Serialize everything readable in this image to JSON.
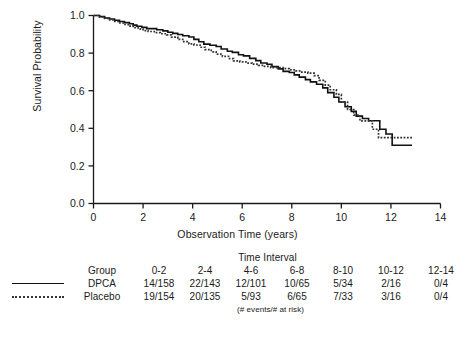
{
  "chart_data": {
    "type": "line",
    "title": "",
    "xlabel": "Observation Time (years)",
    "ylabel": "Survival Probability",
    "xlim": [
      0,
      14
    ],
    "ylim": [
      0,
      1.0
    ],
    "xticks": [
      "0",
      "2",
      "4",
      "6",
      "8",
      "10",
      "12",
      "14"
    ],
    "xtick_values": [
      0,
      2,
      4,
      6,
      8,
      10,
      12,
      14
    ],
    "yticks": [
      "0.0",
      "0.2",
      "0.4",
      "0.6",
      "0.8",
      "1.0"
    ],
    "ytick_values": [
      0.0,
      0.2,
      0.4,
      0.6,
      0.8,
      1.0
    ],
    "grid": false,
    "legend_position": "table-below",
    "step_style": "post",
    "series": [
      {
        "name": "DPCA",
        "style": "solid",
        "color": "#111111",
        "points": [
          [
            0.0,
            1.0
          ],
          [
            0.25,
            0.994
          ],
          [
            0.45,
            0.987
          ],
          [
            0.65,
            0.981
          ],
          [
            0.85,
            0.975
          ],
          [
            1.05,
            0.968
          ],
          [
            1.25,
            0.962
          ],
          [
            1.45,
            0.956
          ],
          [
            1.6,
            0.949
          ],
          [
            1.75,
            0.943
          ],
          [
            1.95,
            0.937
          ],
          [
            2.15,
            0.93
          ],
          [
            2.3,
            0.93
          ],
          [
            2.55,
            0.924
          ],
          [
            2.8,
            0.918
          ],
          [
            3.0,
            0.911
          ],
          [
            3.2,
            0.905
          ],
          [
            3.4,
            0.899
          ],
          [
            3.6,
            0.892
          ],
          [
            3.85,
            0.886
          ],
          [
            4.05,
            0.873
          ],
          [
            4.25,
            0.86
          ],
          [
            4.45,
            0.848
          ],
          [
            4.7,
            0.842
          ],
          [
            4.95,
            0.835
          ],
          [
            5.15,
            0.822
          ],
          [
            5.4,
            0.81
          ],
          [
            5.6,
            0.804
          ],
          [
            5.85,
            0.791
          ],
          [
            6.05,
            0.785
          ],
          [
            6.3,
            0.772
          ],
          [
            6.55,
            0.76
          ],
          [
            6.75,
            0.747
          ],
          [
            7.0,
            0.741
          ],
          [
            7.2,
            0.728
          ],
          [
            7.45,
            0.716
          ],
          [
            7.65,
            0.703
          ],
          [
            7.9,
            0.697
          ],
          [
            8.1,
            0.684
          ],
          [
            8.3,
            0.672
          ],
          [
            8.55,
            0.659
          ],
          [
            8.75,
            0.647
          ],
          [
            9.0,
            0.634
          ],
          [
            9.25,
            0.615
          ],
          [
            9.45,
            0.59
          ],
          [
            9.7,
            0.565
          ],
          [
            9.9,
            0.54
          ],
          [
            10.15,
            0.515
          ],
          [
            10.4,
            0.49
          ],
          [
            10.6,
            0.465
          ],
          [
            10.85,
            0.452
          ],
          [
            11.1,
            0.44
          ],
          [
            11.35,
            0.44
          ],
          [
            11.55,
            0.395
          ],
          [
            11.8,
            0.37
          ],
          [
            12.05,
            0.31
          ],
          [
            12.85,
            0.31
          ]
        ]
      },
      {
        "name": "Placebo",
        "style": "dotted",
        "color": "#333333",
        "points": [
          [
            0.0,
            1.0
          ],
          [
            0.2,
            0.992
          ],
          [
            0.4,
            0.984
          ],
          [
            0.6,
            0.976
          ],
          [
            0.8,
            0.968
          ],
          [
            1.0,
            0.96
          ],
          [
            1.2,
            0.952
          ],
          [
            1.4,
            0.944
          ],
          [
            1.6,
            0.936
          ],
          [
            1.8,
            0.928
          ],
          [
            2.0,
            0.92
          ],
          [
            2.2,
            0.915
          ],
          [
            2.45,
            0.909
          ],
          [
            2.7,
            0.903
          ],
          [
            2.95,
            0.897
          ],
          [
            3.15,
            0.885
          ],
          [
            3.4,
            0.873
          ],
          [
            3.6,
            0.861
          ],
          [
            3.85,
            0.849
          ],
          [
            4.05,
            0.843
          ],
          [
            4.3,
            0.831
          ],
          [
            4.5,
            0.819
          ],
          [
            4.75,
            0.807
          ],
          [
            4.95,
            0.795
          ],
          [
            5.2,
            0.783
          ],
          [
            5.45,
            0.771
          ],
          [
            5.65,
            0.759
          ],
          [
            5.9,
            0.753
          ],
          [
            6.15,
            0.747
          ],
          [
            6.4,
            0.741
          ],
          [
            6.65,
            0.735
          ],
          [
            6.9,
            0.729
          ],
          [
            7.15,
            0.723
          ],
          [
            7.4,
            0.723
          ],
          [
            7.65,
            0.717
          ],
          [
            7.9,
            0.711
          ],
          [
            8.15,
            0.705
          ],
          [
            8.4,
            0.699
          ],
          [
            8.65,
            0.693
          ],
          [
            8.9,
            0.68
          ],
          [
            9.1,
            0.655
          ],
          [
            9.35,
            0.63
          ],
          [
            9.55,
            0.605
          ],
          [
            9.8,
            0.58
          ],
          [
            10.0,
            0.54
          ],
          [
            10.25,
            0.5
          ],
          [
            10.5,
            0.47
          ],
          [
            10.75,
            0.44
          ],
          [
            11.0,
            0.44
          ],
          [
            11.25,
            0.395
          ],
          [
            11.5,
            0.35
          ],
          [
            12.85,
            0.35
          ]
        ]
      }
    ]
  },
  "axes": {
    "ylabel": "Survival Probability",
    "xlabel": "Observation Time (years)"
  },
  "risk_table": {
    "title": "Time Interval",
    "group_header": "Group",
    "interval_headers": [
      "0-2",
      "2-4",
      "4-6",
      "6-8",
      "8-10",
      "10-12",
      "12-14"
    ],
    "rows": [
      {
        "line_style": "solid",
        "group": "DPCA",
        "values": [
          "14/158",
          "22/143",
          "12/101",
          "10/65",
          "5/34",
          "2/16",
          "0/4"
        ]
      },
      {
        "line_style": "dotted",
        "group": "Placebo",
        "values": [
          "19/154",
          "20/135",
          "5/93",
          "6/65",
          "7/33",
          "3/16",
          "0/4"
        ]
      }
    ],
    "footnote": "(# events/# at risk)"
  }
}
